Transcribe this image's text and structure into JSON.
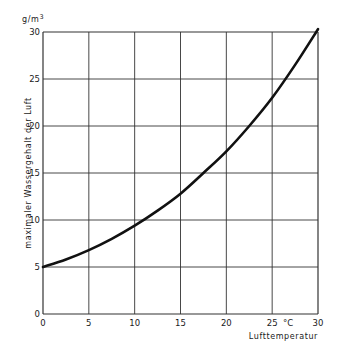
{
  "chart_data": {
    "type": "line",
    "title": "",
    "xlabel": "Lufttemperatur",
    "x_unit": "°C",
    "ylabel": "maximaler Wassergehalt der Luft",
    "y_unit": "g/m3",
    "xlim": [
      0,
      30
    ],
    "ylim": [
      0,
      30
    ],
    "x_ticks": [
      0,
      5,
      10,
      15,
      20,
      25,
      30
    ],
    "y_ticks": [
      0,
      5,
      10,
      15,
      20,
      25,
      30
    ],
    "grid": true,
    "legend": null,
    "series": [
      {
        "name": "maximaler Wassergehalt",
        "x": [
          0,
          2.5,
          5,
          7.5,
          10,
          12.5,
          15,
          17.5,
          20,
          22.5,
          25,
          27.5,
          30
        ],
        "values": [
          5.0,
          5.8,
          6.8,
          8.0,
          9.4,
          11.0,
          12.8,
          15.0,
          17.3,
          20.0,
          23.0,
          26.5,
          30.3
        ]
      }
    ]
  },
  "layout": {
    "plot_left": 43,
    "plot_right": 318,
    "plot_top": 32,
    "plot_bottom": 314,
    "line_color": "#111111",
    "grid_color": "#333333"
  }
}
